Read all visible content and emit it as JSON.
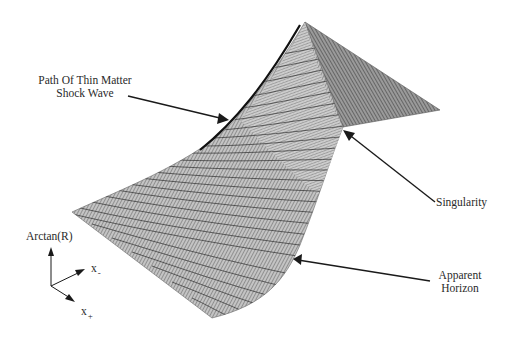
{
  "figure": {
    "type": "3d-mesh-surface"
  },
  "annotations": {
    "shock_wave": {
      "line1": "Path Of Thin Matter",
      "line2": "Shock Wave"
    },
    "singularity": {
      "text": "Singularity"
    },
    "apparent_horizon": {
      "line1": "Apparent",
      "line2": "Horizon"
    }
  },
  "axes": {
    "vertical": "Arctan(R)",
    "x_minus": {
      "base": "x",
      "sub": "-"
    },
    "x_plus": {
      "base": "x",
      "sub": "+"
    }
  },
  "colors": {
    "mesh_dark": "#3a3a3a",
    "mesh_mid": "#8a8a8a",
    "mesh_light": "#b4b4b4",
    "arrow": "#1a1a1a",
    "text": "#2a2a2a"
  }
}
